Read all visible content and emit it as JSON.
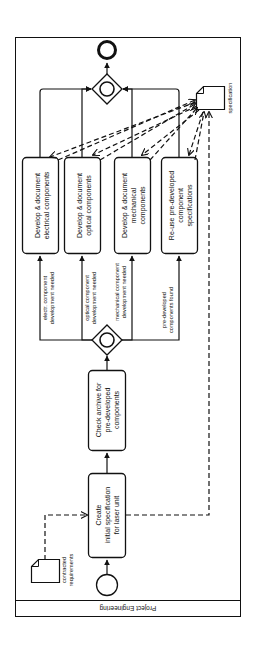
{
  "pool": {
    "label": "Project Engineering"
  },
  "events": {
    "start": "start-event",
    "end": "end-event"
  },
  "tasks": [
    {
      "id": "create-spec",
      "lines": [
        "Create",
        "initial specification",
        "for laser unit"
      ]
    },
    {
      "id": "check-archive",
      "lines": [
        "Check archive for",
        "pre-developed",
        "components"
      ]
    },
    {
      "id": "dev-electrical",
      "lines": [
        "Develop & document",
        "electrical components"
      ]
    },
    {
      "id": "dev-optical",
      "lines": [
        "Develop & document",
        "optical components"
      ]
    },
    {
      "id": "dev-mechanical",
      "lines": [
        "Develop & document",
        "mechanical",
        "components"
      ]
    },
    {
      "id": "reuse-specs",
      "lines": [
        "Re-use pre-developed",
        "component",
        "specifications"
      ]
    }
  ],
  "flow_labels": {
    "electrical": [
      "electr. component",
      "development needed"
    ],
    "optical": [
      "optical component",
      "development needed"
    ],
    "mechanical": [
      "mechanical component",
      "development needed"
    ],
    "predeveloped": [
      "pre-developed",
      "components found"
    ]
  },
  "data_objects": {
    "contracted": [
      "contracted",
      "requirements"
    ],
    "specification": "specification"
  },
  "colors": {
    "stroke": "#111111",
    "background": "#ffffff"
  }
}
